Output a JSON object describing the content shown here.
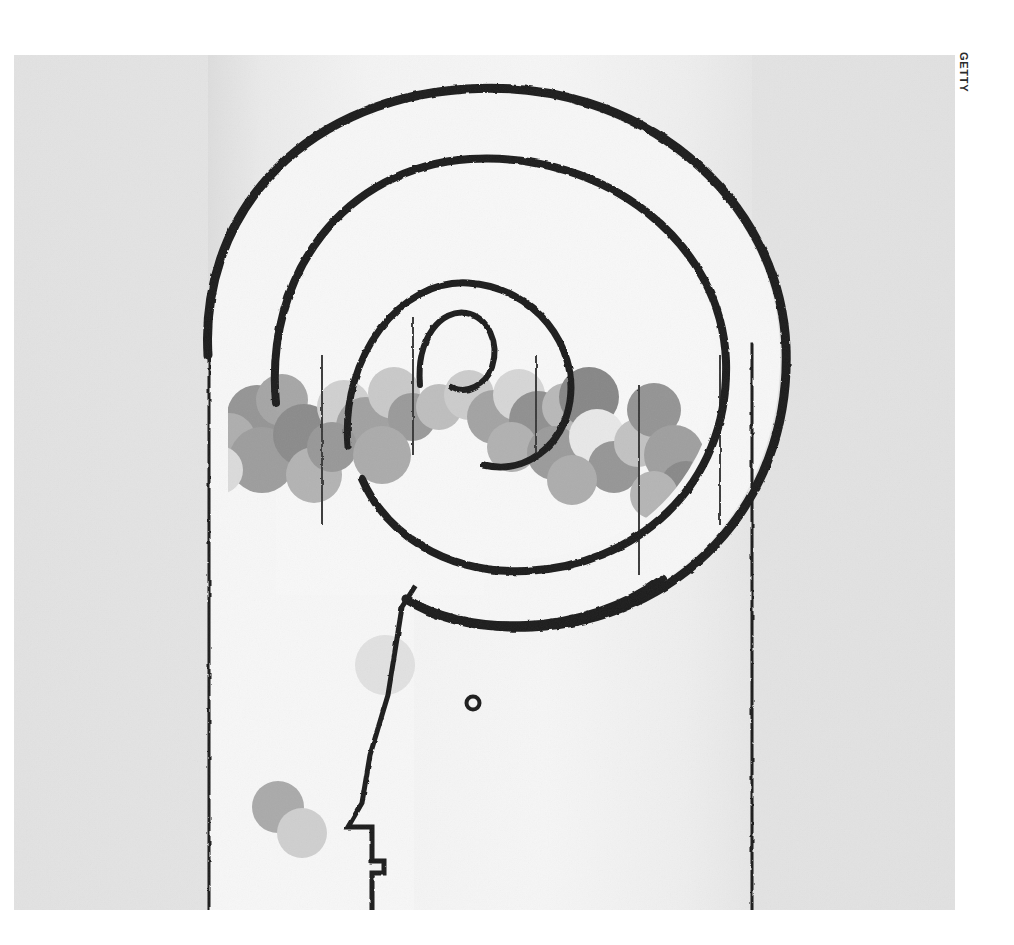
{
  "page": {
    "background_color": "#ffffff",
    "width": 1014,
    "height": 945
  },
  "credit": {
    "text": "GETTY",
    "orientation": "vertical",
    "color": "#2b2b2b"
  },
  "illustration": {
    "title": "Spiral head profile with bubbles",
    "description": "Minimalist line illustration of a human head in profile whose cranium is drawn as a large inward spiral; the spiral chamber is filled with overlapping grey spheres.",
    "background_color": "#e4e4e4",
    "column_fill": "#f2f2f2",
    "line_color": "#1c1c1c",
    "bounds": {
      "x": 14,
      "y": 55,
      "width": 941,
      "height": 855
    },
    "columns": {
      "left_edge_x": 194,
      "right_edge_x": 738,
      "top_y": 0,
      "bottom_y": 855
    },
    "face": {
      "eye": {
        "cx": 459,
        "cy": 648,
        "r": 6,
        "color": "#1c1c1c"
      },
      "forehead_blob": {
        "cx": 371,
        "cy": 610,
        "r": 30,
        "color": "#e9e9e9"
      },
      "profile_points": "forehead, brow, nose ridge, nose tip, upper lip, mouth, lower lip, chin, jaw"
    },
    "bubbles": [
      {
        "cx": 243,
        "cy": 360,
        "r": 30,
        "color": "#9a9a9a"
      },
      {
        "cx": 268,
        "cy": 345,
        "r": 26,
        "color": "#ababab"
      },
      {
        "cx": 215,
        "cy": 385,
        "r": 27,
        "color": "#b4b4b4"
      },
      {
        "cx": 248,
        "cy": 405,
        "r": 33,
        "color": "#a2a2a2"
      },
      {
        "cx": 205,
        "cy": 415,
        "r": 24,
        "color": "#e2e2e2"
      },
      {
        "cx": 290,
        "cy": 380,
        "r": 31,
        "color": "#8f8f8f"
      },
      {
        "cx": 300,
        "cy": 420,
        "r": 28,
        "color": "#b8b8b8"
      },
      {
        "cx": 330,
        "cy": 352,
        "r": 27,
        "color": "#d6d6d6"
      },
      {
        "cx": 352,
        "cy": 372,
        "r": 30,
        "color": "#a6a6a6"
      },
      {
        "cx": 318,
        "cy": 392,
        "r": 25,
        "color": "#9c9c9c"
      },
      {
        "cx": 380,
        "cy": 338,
        "r": 26,
        "color": "#cfcfcf"
      },
      {
        "cx": 398,
        "cy": 362,
        "r": 24,
        "color": "#9e9e9e"
      },
      {
        "cx": 368,
        "cy": 400,
        "r": 29,
        "color": "#b0b0b0"
      },
      {
        "cx": 425,
        "cy": 352,
        "r": 23,
        "color": "#c4c4c4"
      },
      {
        "cx": 455,
        "cy": 340,
        "r": 25,
        "color": "#d2d2d2"
      },
      {
        "cx": 480,
        "cy": 362,
        "r": 27,
        "color": "#a8a8a8"
      },
      {
        "cx": 505,
        "cy": 340,
        "r": 26,
        "color": "#dcdcdc"
      },
      {
        "cx": 524,
        "cy": 365,
        "r": 29,
        "color": "#949494"
      },
      {
        "cx": 552,
        "cy": 352,
        "r": 24,
        "color": "#bdbdbd"
      },
      {
        "cx": 498,
        "cy": 392,
        "r": 25,
        "color": "#b6b6b6"
      },
      {
        "cx": 540,
        "cy": 398,
        "r": 27,
        "color": "#a0a0a0"
      },
      {
        "cx": 575,
        "cy": 342,
        "r": 30,
        "color": "#8b8b8b"
      },
      {
        "cx": 583,
        "cy": 382,
        "r": 28,
        "color": "#efefef"
      },
      {
        "cx": 600,
        "cy": 412,
        "r": 26,
        "color": "#9a9a9a"
      },
      {
        "cx": 558,
        "cy": 425,
        "r": 25,
        "color": "#b2b2b2"
      },
      {
        "cx": 624,
        "cy": 388,
        "r": 24,
        "color": "#c8c8c8"
      },
      {
        "cx": 640,
        "cy": 355,
        "r": 27,
        "color": "#989898"
      },
      {
        "cx": 660,
        "cy": 400,
        "r": 30,
        "color": "#a4a4a4"
      },
      {
        "cx": 672,
        "cy": 432,
        "r": 26,
        "color": "#8d8d8d"
      },
      {
        "cx": 640,
        "cy": 440,
        "r": 24,
        "color": "#bababa"
      },
      {
        "cx": 700,
        "cy": 420,
        "r": 25,
        "color": "#c0c0c0"
      },
      {
        "cx": 706,
        "cy": 452,
        "r": 27,
        "color": "#9b9b9b"
      },
      {
        "cx": 678,
        "cy": 470,
        "r": 24,
        "color": "#b5b5b5"
      },
      {
        "cx": 720,
        "cy": 398,
        "r": 22,
        "color": "#d8d8d8"
      },
      {
        "cx": 264,
        "cy": 752,
        "r": 26,
        "color": "#b0b0b0"
      },
      {
        "cx": 288,
        "cy": 778,
        "r": 25,
        "color": "#d4d4d4"
      }
    ]
  }
}
